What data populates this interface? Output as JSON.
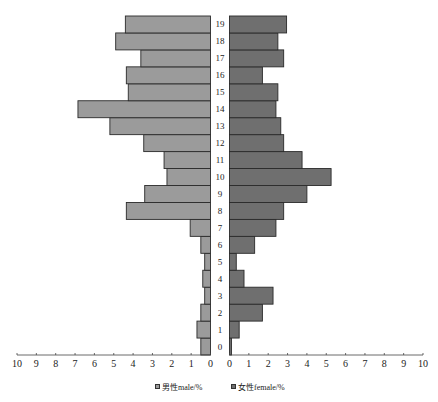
{
  "chart_data": {
    "type": "bar",
    "orientation": "horizontal",
    "subtype": "population-pyramid",
    "title": "",
    "categories": [
      "0",
      "1",
      "2",
      "3",
      "4",
      "5",
      "6",
      "7",
      "8",
      "9",
      "10",
      "11",
      "12",
      "13",
      "14",
      "15",
      "16",
      "17",
      "18",
      "19"
    ],
    "series": [
      {
        "name": "男性male/%",
        "side": "left",
        "color": "#9b9b9b",
        "values": [
          0.5,
          0.7,
          0.5,
          0.3,
          0.4,
          0.3,
          0.5,
          1.05,
          4.35,
          3.4,
          2.25,
          2.4,
          3.45,
          5.2,
          6.85,
          4.25,
          4.35,
          3.6,
          4.9,
          4.4
        ]
      },
      {
        "name": "女性female/%",
        "side": "right",
        "color": "#6f6f6f",
        "values": [
          0.1,
          0.5,
          1.7,
          2.25,
          0.75,
          0.35,
          1.3,
          2.4,
          2.8,
          4.0,
          5.25,
          3.75,
          2.8,
          2.65,
          2.4,
          2.5,
          1.7,
          2.8,
          2.5,
          2.95
        ]
      }
    ],
    "xlabel": "",
    "ylabel": "",
    "left_axis_ticks": [
      "10",
      "9",
      "8",
      "7",
      "6",
      "5",
      "4",
      "3",
      "2",
      "1",
      "0"
    ],
    "right_axis_ticks": [
      "0",
      "1",
      "2",
      "3",
      "4",
      "5",
      "6",
      "7",
      "8",
      "9",
      "10"
    ],
    "xlim": [
      0,
      10
    ],
    "grid": false,
    "legend_position": "bottom"
  },
  "legend": {
    "male_label": "男性male/%",
    "female_label": "女性female/%"
  }
}
